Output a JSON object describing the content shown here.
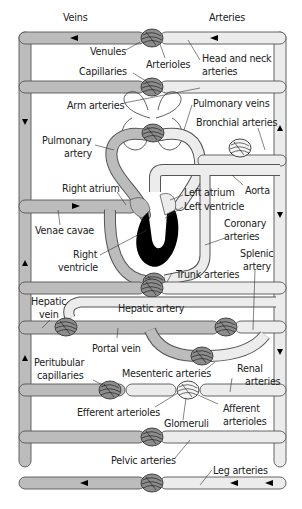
{
  "colors": {
    "veins": "#bcbcbc",
    "arteries": "#ececec",
    "outline": "#555555",
    "capillary_bed": "#8c8c8c",
    "heart": "#000000",
    "background": "#ffffff"
  },
  "labels": {
    "veins": "Veins",
    "arteries": "Arteries",
    "venules": "Venules",
    "arterioles": "Arterioles",
    "head_neck_1": "Head and neck",
    "head_neck_2": "arteries",
    "capillaries": "Capillaries",
    "arm_arteries": "Arm arteries",
    "pulmonary_veins": "Pulmonary veins",
    "bronchial_arteries": "Bronchial arteries",
    "pulmonary_artery_1": "Pulmonary",
    "pulmonary_artery_2": "artery",
    "right_atrium": "Right atrium",
    "left_atrium": "Left atrium",
    "left_ventricle": "Left ventricle",
    "aorta": "Aorta",
    "venae_cavae": "Venae cavae",
    "coronary_1": "Coronary",
    "coronary_2": "arteries",
    "right_ventricle_1": "Right",
    "right_ventricle_2": "ventricle",
    "splenic_1": "Splenic",
    "splenic_2": "artery",
    "trunk_arteries": "Trunk arteries",
    "hepatic_vein_1": "Hepatic",
    "hepatic_vein_2": "vein",
    "hepatic_artery": "Hepatic artery",
    "portal_vein": "Portal vein",
    "peritubular_1": "Peritubular",
    "peritubular_2": "capillaries",
    "mesenteric_arteries": "Mesenteric arteries",
    "renal_1": "Renal",
    "renal_2": "arteries",
    "efferent_arterioles": "Efferent arterioles",
    "afferent_1": "Afferent",
    "afferent_2": "arterioles",
    "glomeruli": "Glomeruli",
    "pelvic_arteries": "Pelvic arteries",
    "leg_arteries": "Leg arteries"
  }
}
